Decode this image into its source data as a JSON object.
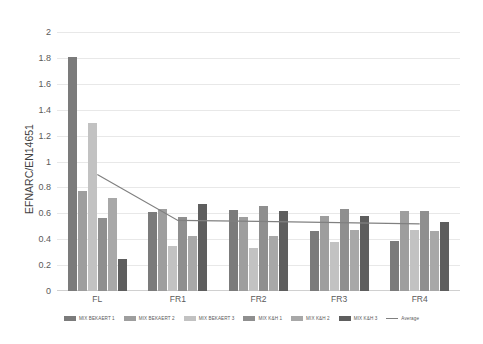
{
  "chart_data": {
    "type": "bar",
    "title": "",
    "xlabel": "",
    "ylabel": "EFNARC/EN14651",
    "ylim": [
      0,
      2
    ],
    "ytick_step": 0.2,
    "ytick_labels": [
      "0",
      "0.2",
      "0.4",
      "0.6",
      "0.8",
      "1",
      "1.2",
      "1.4",
      "1.6",
      "1.8",
      "2"
    ],
    "grid": true,
    "legend_position": "bottom",
    "categories": [
      "FL",
      "FR1",
      "FR2",
      "FR3",
      "FR4"
    ],
    "series": [
      {
        "name": "MIX BEKAERT 1",
        "color": "#7b7b7b",
        "values": [
          1.81,
          0.61,
          0.625,
          0.465,
          0.39
        ]
      },
      {
        "name": "MIX BEKAERT 2",
        "color": "#9e9e9e",
        "values": [
          0.77,
          0.635,
          0.575,
          0.58,
          0.615
        ]
      },
      {
        "name": "MIX BEKAERT 3",
        "color": "#c2c2c2",
        "values": [
          1.3,
          0.345,
          0.335,
          0.38,
          0.475
        ]
      },
      {
        "name": "MIX K&H 1",
        "color": "#8f8f8f",
        "values": [
          0.56,
          0.575,
          0.655,
          0.63,
          0.62
        ]
      },
      {
        "name": "MIX K&H 2",
        "color": "#a8a8a8",
        "values": [
          0.72,
          0.425,
          0.425,
          0.47,
          0.46
        ]
      },
      {
        "name": "MIX K&H 3",
        "color": "#5e5e5e",
        "values": [
          0.25,
          0.67,
          0.615,
          0.58,
          0.535
        ]
      }
    ],
    "average_line": {
      "name": "Average",
      "color": "#808080",
      "values": [
        0.9,
        0.545,
        0.538,
        0.528,
        0.518
      ]
    }
  },
  "axis": {
    "y_title": "EFNARC/EN14651"
  },
  "legend": {
    "items": [
      {
        "label": "MIX BEKAERT 1",
        "color": "#7b7b7b",
        "kind": "bar"
      },
      {
        "label": "MIX BEKAERT 2",
        "color": "#9e9e9e",
        "kind": "bar"
      },
      {
        "label": "MIX BEKAERT 3",
        "color": "#c2c2c2",
        "kind": "bar"
      },
      {
        "label": "MIX K&H 1",
        "color": "#8f8f8f",
        "kind": "bar"
      },
      {
        "label": "MIX K&H 2",
        "color": "#a8a8a8",
        "kind": "bar"
      },
      {
        "label": "MIX K&H 3",
        "color": "#5e5e5e",
        "kind": "bar"
      },
      {
        "label": "Average",
        "color": "#808080",
        "kind": "line"
      }
    ]
  }
}
